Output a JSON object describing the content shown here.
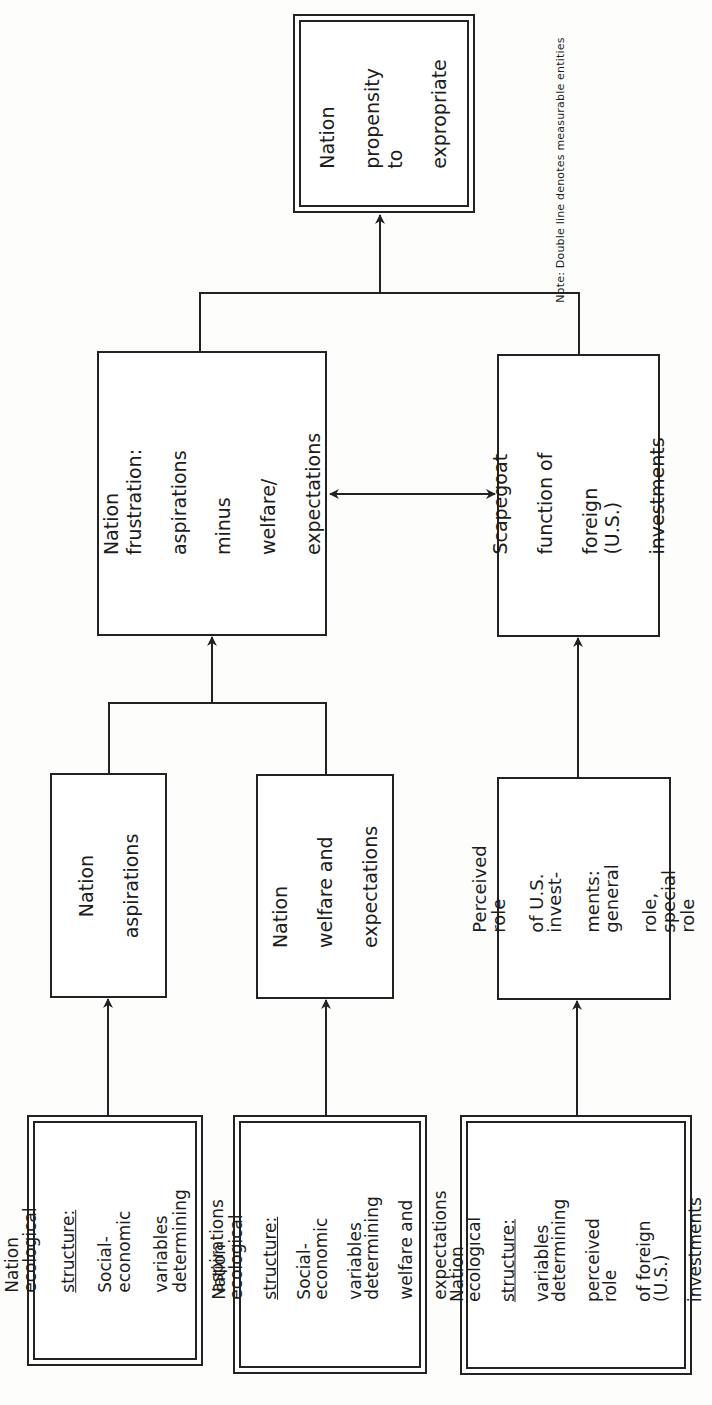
{
  "diagram": {
    "note": "Note:  Double line denotes measurable entities",
    "nodes": {
      "propensity": {
        "lines": [
          "Nation",
          "propensity to",
          "expropriate"
        ],
        "double": true
      },
      "frustration": {
        "lines": [
          "Nation frustration:",
          "aspirations",
          "minus",
          "welfare/",
          "expectations"
        ],
        "double": false
      },
      "scapegoat": {
        "lines": [
          "Scapegoat",
          "function of",
          "foreign  (U.S.)",
          "investments"
        ],
        "double": false
      },
      "aspirations": {
        "lines": [
          "Nation",
          "aspirations"
        ],
        "double": false
      },
      "welfare": {
        "lines": [
          "Nation",
          "welfare and",
          "expectations"
        ],
        "double": false
      },
      "perceived_role": {
        "lines": [
          "Perceived role",
          "of U.S. invest-",
          "ments:  general",
          "role, special role"
        ],
        "double": false
      },
      "eco_aspirations": {
        "line1": "Nation  ecological",
        "underlined": "structure:",
        "rest": [
          "Social-economic",
          "variables determining",
          "aspirations"
        ],
        "double": true
      },
      "eco_welfare": {
        "line1": "Nation ecological",
        "underlined": "structure:",
        "rest": [
          "Social-economic",
          "variables determining",
          "welfare and",
          "expectations"
        ],
        "double": true
      },
      "eco_role": {
        "line1": "Nation  ecological",
        "underlined": "structure:",
        "rest": [
          "variables determining",
          "perceived role",
          "of foreign (U.S.)",
          "investments"
        ],
        "double": true
      }
    },
    "edges": [
      {
        "from": "eco_aspirations",
        "to": "aspirations",
        "type": "arrow"
      },
      {
        "from": "eco_welfare",
        "to": "welfare",
        "type": "arrow"
      },
      {
        "from": "eco_role",
        "to": "perceived_role",
        "type": "arrow"
      },
      {
        "from": [
          "aspirations",
          "welfare"
        ],
        "to": "frustration",
        "type": "merge-arrow"
      },
      {
        "from": "perceived_role",
        "to": "scapegoat",
        "type": "arrow"
      },
      {
        "from": "frustration",
        "to": "scapegoat",
        "type": "bidirectional"
      },
      {
        "from": [
          "frustration",
          "scapegoat"
        ],
        "to": "propensity",
        "type": "merge-arrow"
      }
    ]
  }
}
